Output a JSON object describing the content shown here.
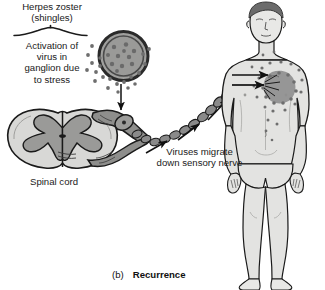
{
  "figure": {
    "caption_letter": "(b)",
    "caption_title": "Recurrence",
    "width": 325,
    "height": 290
  },
  "labels": {
    "herpes_zoster": "Herpes zoster\n(shingles)",
    "activation": "Activation of\nvirus in\nganglion due\nto stress",
    "spinal_cord": "Spinal cord",
    "viruses_migrate": "Viruses migrate\ndown sensory nerve"
  },
  "colors": {
    "background": "#ffffff",
    "outline": "#1a1a1a",
    "text": "#1a1a1a",
    "skin_fill": "#e3e3e1",
    "skin_shadow": "#cfcfcb",
    "virus_capsid": "#8c8c8c",
    "virus_core": "#9e9e9e",
    "virus_dark_ring": "#3b3b3b",
    "virion_dot": "#6e6e6e",
    "nerve_bead": "#8a8a8a",
    "cord_white_matter": "#d8d8d6",
    "cord_gray_matter": "#9a9a98",
    "rash": "#8f8f8f",
    "hair": "#6b6b6b"
  },
  "elements": {
    "brace_label": "curly-brace",
    "virus_particle_label": "varicella-zoster-virion",
    "virion_count": 21,
    "nerve_bead_count": 14,
    "arrow_down_label": "arrow-virus-to-ganglion",
    "arrow_migrate_count": 3,
    "arrow_rash_label": "arrow-to-rash",
    "human_figure_label": "male-body-anterior",
    "rash_label": "shingles-rash-dermatome"
  }
}
